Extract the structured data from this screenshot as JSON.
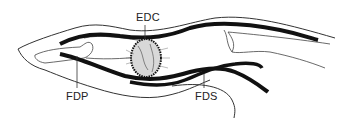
{
  "diagram": {
    "type": "anatomical-illustration",
    "labels": [
      {
        "id": "edc",
        "text": "EDC"
      },
      {
        "id": "fdp",
        "text": "FDP"
      },
      {
        "id": "fds",
        "text": "FDS"
      }
    ],
    "colors": {
      "ink": "#111111",
      "outline": "#333333",
      "background": "#ffffff"
    }
  }
}
